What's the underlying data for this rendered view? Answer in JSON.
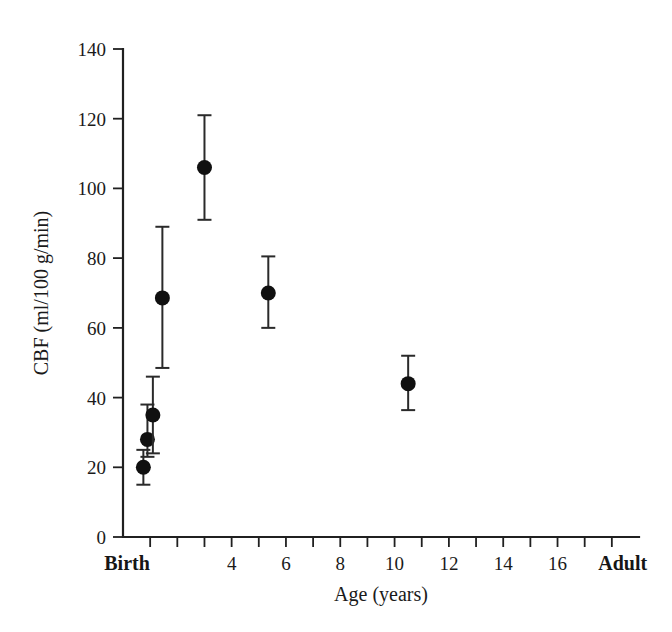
{
  "chart_data": {
    "type": "scatter",
    "title": "",
    "xlabel": "Age (years)",
    "ylabel": "CBF (ml/100 g/min)",
    "xlim": [
      0,
      19
    ],
    "ylim": [
      0,
      140
    ],
    "grid": false,
    "legend": null,
    "y_ticks": [
      0,
      20,
      40,
      60,
      80,
      100,
      120,
      140
    ],
    "y_tick_labels": [
      "0",
      "20",
      "40",
      "60",
      "80",
      "100",
      "120",
      "140"
    ],
    "x_tick_positions": [
      1,
      2,
      3,
      4,
      5,
      6,
      7,
      8,
      9,
      10,
      11,
      12,
      13,
      14,
      15,
      16,
      17,
      18
    ],
    "x_tick_labels": [
      "",
      "",
      "",
      "4",
      "",
      "6",
      "",
      "8",
      "",
      "10",
      "",
      "12",
      "",
      "14",
      "",
      "16",
      "",
      ""
    ],
    "x_category_labels": [
      {
        "label": "Birth",
        "x": 0.15
      },
      {
        "label": "Adult",
        "x": 18.4
      }
    ],
    "error_type": "error bars (vertical, capped)",
    "points": [
      {
        "x": 0.75,
        "y": 20,
        "y_low": 15,
        "y_high": 25,
        "group": "neonate"
      },
      {
        "x": 0.9,
        "y": 28,
        "y_low": 23,
        "y_high": 38,
        "group": "infant"
      },
      {
        "x": 1.1,
        "y": 35,
        "y_low": 24,
        "y_high": 46,
        "group": "infant"
      },
      {
        "x": 1.45,
        "y": 68.6,
        "y_low": 48.5,
        "y_high": 89,
        "group": "toddler"
      },
      {
        "x": 3.0,
        "y": 106,
        "y_low": 91,
        "y_high": 121,
        "group": "child-4y"
      },
      {
        "x": 5.35,
        "y": 70,
        "y_low": 60,
        "y_high": 80.5,
        "group": "child-9y"
      },
      {
        "x": 10.5,
        "y": 44,
        "y_low": 36.4,
        "y_high": 52,
        "group": "adult"
      }
    ]
  }
}
